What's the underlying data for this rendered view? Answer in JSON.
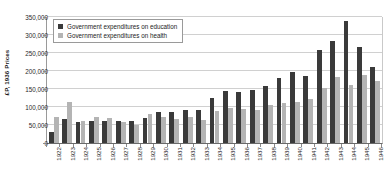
{
  "chart_data": {
    "type": "bar",
    "title": "",
    "xlabel": "",
    "ylabel": "£P, 1936 Prices",
    "ylim": [
      0,
      350000
    ],
    "yticks": [
      0,
      50000,
      100000,
      150000,
      200000,
      250000,
      300000,
      350000
    ],
    "ytick_labels": [
      "0",
      "50,000",
      "100,000",
      "150,000",
      "200,000",
      "250,000",
      "300,000",
      "350,000"
    ],
    "grid": true,
    "legend_position": "upper-left-inside",
    "categories": [
      "1922",
      "1923",
      "1924",
      "1925",
      "1926",
      "1927",
      "1928",
      "1929",
      "1930",
      "1931",
      "1932",
      "1933",
      "1934",
      "1935",
      "1936",
      "1937",
      "1938",
      "1939",
      "1940",
      "1941",
      "1942",
      "1943",
      "1944",
      "1945",
      "1946"
    ],
    "series": [
      {
        "name": "Government expenditures on education",
        "color": "#3a3a3a",
        "values": [
          30000,
          68000,
          57000,
          62000,
          60000,
          60000,
          62000,
          70000,
          86000,
          87000,
          91000,
          92000,
          125000,
          145000,
          142000,
          148000,
          158000,
          180000,
          196000,
          186000,
          258000,
          282000,
          340000,
          268000,
          210000
        ]
      },
      {
        "name": "Government expenditures on health",
        "color": "#b4b4b4",
        "values": [
          73000,
          113000,
          62000,
          73000,
          69000,
          58000,
          50000,
          80000,
          72000,
          68000,
          71000,
          65000,
          88000,
          98000,
          95000,
          92000,
          105000,
          110000,
          115000,
          122000,
          152000,
          183000,
          160000,
          188000,
          172000
        ]
      }
    ],
    "trailing_values": {
      "note_years": [
        "1941",
        "1942",
        "1943",
        "1944",
        "1945",
        "1946"
      ],
      "education": [
        196000,
        156000,
        163000,
        152000,
        168000,
        200000
      ],
      "health": [
        158000,
        146000,
        130000,
        142000,
        160000,
        196000
      ]
    }
  },
  "legend": {
    "items": [
      {
        "label": "Government expenditures on education",
        "swatch": "education"
      },
      {
        "label": "Government expenditures on health",
        "swatch": "health"
      }
    ]
  }
}
